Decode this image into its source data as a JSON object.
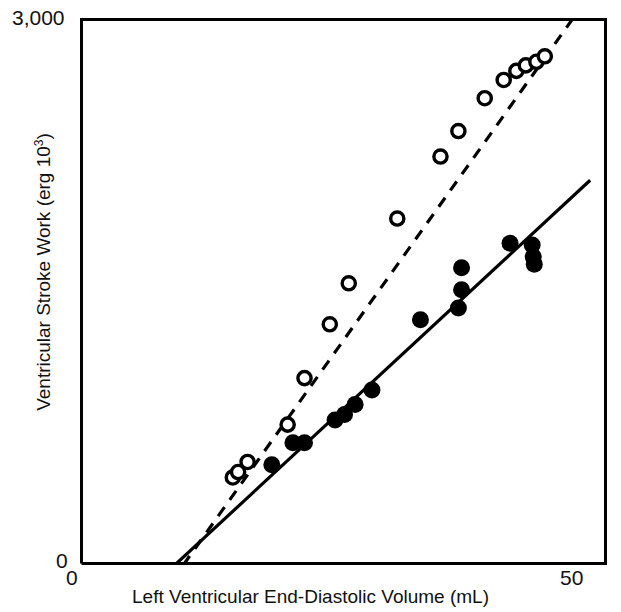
{
  "axes": {
    "y": {
      "label_text": "Ventricular Stroke Work (erg 10",
      "label_sup": "3",
      "label_tail": ")",
      "tick_max": "3,000",
      "tick_min": "0",
      "min": 0,
      "max": 3000
    },
    "x": {
      "label": "Left Ventricular End-Diastolic Volume (mL)",
      "tick_min": "0",
      "tick_max": "50",
      "min": 0,
      "max": 50
    },
    "frame_color": "#000000",
    "frame_width": 3
  },
  "chart_data": {
    "type": "scatter",
    "title": "",
    "xlabel": "Left Ventricular End-Diastolic Volume (mL)",
    "ylabel": "Ventricular Stroke Work (erg 10^3)",
    "xlim": [
      0,
      50
    ],
    "ylim": [
      0,
      3000
    ],
    "grid": false,
    "legend": "none",
    "series": [
      {
        "name": "open-circles",
        "marker": "open-circle",
        "line_style": "dashed",
        "line_color": "#000000",
        "points": [
          {
            "x": 14.5,
            "y": 480
          },
          {
            "x": 15.0,
            "y": 510
          },
          {
            "x": 15.9,
            "y": 565
          },
          {
            "x": 19.7,
            "y": 770
          },
          {
            "x": 21.3,
            "y": 1025
          },
          {
            "x": 23.7,
            "y": 1320
          },
          {
            "x": 25.5,
            "y": 1545
          },
          {
            "x": 30.1,
            "y": 1900
          },
          {
            "x": 34.2,
            "y": 2240
          },
          {
            "x": 35.9,
            "y": 2380
          },
          {
            "x": 38.4,
            "y": 2560
          },
          {
            "x": 40.2,
            "y": 2660
          },
          {
            "x": 41.4,
            "y": 2710
          },
          {
            "x": 42.3,
            "y": 2740
          },
          {
            "x": 43.3,
            "y": 2760
          },
          {
            "x": 44.1,
            "y": 2790
          }
        ],
        "fit_line": {
          "x0": 9.8,
          "y0": 0,
          "x1": 46.8,
          "y1": 3000
        }
      },
      {
        "name": "filled-circles",
        "marker": "filled-circle",
        "line_style": "solid",
        "line_color": "#000000",
        "points": [
          {
            "x": 18.2,
            "y": 550
          },
          {
            "x": 20.2,
            "y": 670
          },
          {
            "x": 21.3,
            "y": 670
          },
          {
            "x": 24.2,
            "y": 795
          },
          {
            "x": 25.1,
            "y": 825
          },
          {
            "x": 26.1,
            "y": 880
          },
          {
            "x": 27.7,
            "y": 960
          },
          {
            "x": 32.3,
            "y": 1345
          },
          {
            "x": 35.9,
            "y": 1410
          },
          {
            "x": 36.2,
            "y": 1510
          },
          {
            "x": 36.2,
            "y": 1630
          },
          {
            "x": 40.8,
            "y": 1765
          },
          {
            "x": 42.9,
            "y": 1755
          },
          {
            "x": 43.0,
            "y": 1690
          },
          {
            "x": 43.1,
            "y": 1650
          }
        ],
        "fit_line": {
          "x0": 9.0,
          "y0": 0,
          "x1": 48.4,
          "y1": 2110
        }
      }
    ]
  }
}
